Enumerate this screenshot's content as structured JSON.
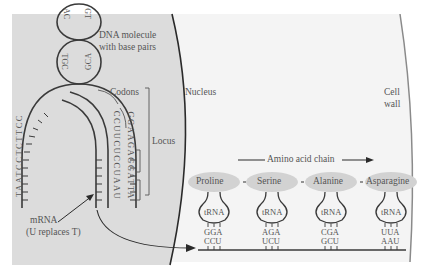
{
  "figure": {
    "regions": {
      "nucleus": {
        "label": "Nucleus",
        "fill": "#dcdcdc"
      },
      "cytoplasm": {
        "fill": "#f4f4f4"
      },
      "cell_wall": {
        "label_line1": "Cell",
        "label_line2": "wall"
      }
    },
    "labels": {
      "dna_line1": "DNA molecule",
      "dna_line2": "with base pairs",
      "codons": "Codons",
      "locus": "Locus",
      "mrna_line1": "mRNA",
      "mrna_line2": "(U replaces T)",
      "amino_acid_chain": "Amino acid chain"
    },
    "dna_helix": {
      "top_loop_left": "AC",
      "top_loop_right": "GT",
      "mid_loop_left": "TGC",
      "mid_loop_right": "GCA"
    },
    "dna_strands": {
      "outer_left_strand": "TAATCCTCTTCC",
      "template_strand": "GGAAGAGGATTA",
      "mrna_strand": "CCUUCUCCUAAU"
    },
    "amino_acids": [
      {
        "name": "Proline",
        "anticodon": "GGA",
        "codon": "CCU"
      },
      {
        "name": "Serine",
        "anticodon": "AGA",
        "codon": "UCU"
      },
      {
        "name": "Alanine",
        "anticodon": "CGA",
        "codon": "GCU"
      },
      {
        "name": "Asparagine",
        "anticodon": "UUA",
        "codon": "AAU"
      }
    ],
    "trna_label": "tRNA",
    "colors": {
      "nucleus_fill": "#dcdcdc",
      "ellipse_fill": "#d2d2d2",
      "stroke": "#3a3a3a",
      "text": "#555555"
    }
  }
}
